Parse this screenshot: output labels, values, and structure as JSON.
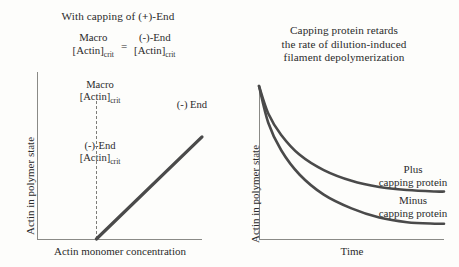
{
  "figure": {
    "background_color": "#fdfdfb",
    "line_color": "#4a4a4a",
    "axis_color": "#8a8a86"
  },
  "left_panel": {
    "title_prefix": "With capping of (",
    "title_plus": "+",
    "title_suffix": ")-End",
    "equation": {
      "left_numerator": "Macro",
      "left_denominator_base": "[Actin]",
      "left_denominator_sub": "crit",
      "operator": "=",
      "right_numerator": "(-)-End",
      "right_denominator_base": "[Actin]",
      "right_denominator_sub": "crit"
    },
    "macro_note_line1": "Macro",
    "macro_note_base": "[Actin]",
    "macro_note_sub": "crit",
    "minus_end_note_line1": "(-)-End",
    "minus_end_note_base": "[Actin]",
    "minus_end_note_sub": "crit",
    "curve_label": "(-) End",
    "ylabel": "Actin in polymer state",
    "xlabel": "Actin monomer concentration"
  },
  "right_panel": {
    "title": "Capping protein retards\nthe rate of dilution-induced\nfilament depolymerization",
    "ylabel": "Actin in polymer state",
    "xlabel": "Time",
    "plus_label": "Plus\ncapping protein",
    "minus_label": "Minus\ncapping protein"
  },
  "chart_data": [
    {
      "type": "line",
      "panel": "left",
      "title": "With capping of (+)-End",
      "xlabel": "Actin monomer concentration",
      "ylabel": "Actin in polymer state",
      "grid": false,
      "legend": "inline-annotation",
      "xlim": [
        0,
        100
      ],
      "ylim": [
        0,
        100
      ],
      "annotations": [
        {
          "text": "Macro [Actin]crit",
          "x": 36,
          "y": 92
        },
        {
          "text": "(-)-End [Actin]crit",
          "x": 36,
          "y": 56
        },
        {
          "text": "(-) End",
          "x": 86,
          "y": 80
        }
      ],
      "reference_lines": [
        {
          "orientation": "vertical",
          "x": 36,
          "style": "dashed",
          "label": "critical concentration"
        }
      ],
      "series": [
        {
          "name": "(-) End",
          "style": "solid",
          "x": [
            36,
            100
          ],
          "y": [
            0,
            74
          ]
        }
      ]
    },
    {
      "type": "line",
      "panel": "right",
      "title": "Capping protein retards the rate of dilution-induced filament depolymerization",
      "xlabel": "Time",
      "ylabel": "Actin in polymer state",
      "grid": false,
      "legend": "inline-annotation",
      "xlim": [
        0,
        100
      ],
      "ylim": [
        0,
        100
      ],
      "series": [
        {
          "name": "Plus capping protein",
          "style": "solid",
          "x": [
            0,
            5,
            12,
            22,
            35,
            50,
            65,
            80,
            95,
            100
          ],
          "y": [
            100,
            82,
            68,
            55,
            45,
            38,
            34,
            32,
            31,
            31
          ]
        },
        {
          "name": "Minus capping protein",
          "style": "solid",
          "x": [
            0,
            5,
            12,
            22,
            35,
            50,
            65,
            80,
            95,
            100
          ],
          "y": [
            100,
            76,
            58,
            42,
            29,
            20,
            14,
            11,
            10,
            10
          ]
        }
      ]
    }
  ]
}
